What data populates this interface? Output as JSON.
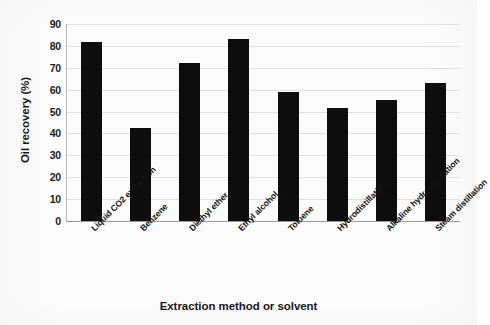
{
  "chart_data": {
    "type": "bar",
    "title": "",
    "xlabel": "Extraction method or solvent",
    "ylabel": "Oil recovery (%)",
    "ylim": [
      0,
      90
    ],
    "yticks": [
      90,
      80,
      70,
      60,
      50,
      40,
      30,
      20,
      10,
      0
    ],
    "grid": true,
    "legend": false,
    "bar_color": "#0d0d0d",
    "categories": [
      "Liquid CO2 extraction",
      "Benzene",
      "Diethyl ether",
      "Ethyl alcohol",
      "Toluene",
      "Hydrodistillation",
      "Alkaline hydrodistillation",
      "Steam distillation"
    ],
    "values": [
      82,
      42.5,
      72,
      83,
      59,
      51.5,
      55.5,
      63
    ]
  }
}
